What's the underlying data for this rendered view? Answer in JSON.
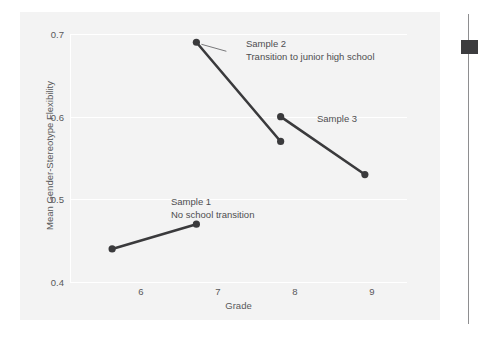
{
  "chart_data": {
    "type": "line",
    "title": "",
    "xlabel": "Grade",
    "ylabel": "Mean Gender-Stereotype Flexibility",
    "xlim": [
      5.5,
      9.5
    ],
    "ylim": [
      0.4,
      0.7
    ],
    "xticks": [
      "6",
      "7",
      "8",
      "9"
    ],
    "xtick_values": [
      6,
      7,
      8,
      9
    ],
    "yticks": [
      "0.4",
      "0.5",
      "0.6",
      "0.7"
    ],
    "ytick_values": [
      0.4,
      0.5,
      0.6,
      0.7
    ],
    "grid": true,
    "legend": "none",
    "series": [
      {
        "name": "Sample 1",
        "x": [
          6,
          7
        ],
        "values": [
          0.44,
          0.47
        ],
        "color": "#3a3a3c",
        "marker": "circle"
      },
      {
        "name": "Sample 2",
        "x": [
          7,
          8
        ],
        "values": [
          0.69,
          0.57
        ],
        "color": "#3a3a3c",
        "marker": "circle"
      },
      {
        "name": "Sample 3",
        "x": [
          8,
          9
        ],
        "values": [
          0.6,
          0.53
        ],
        "color": "#3a3a3c",
        "marker": "circle"
      }
    ],
    "annotations": [
      {
        "id": "sample2",
        "line1": "Sample 2",
        "line2": "Transition to junior high school",
        "points_to": [
          7,
          0.69
        ],
        "leader_line": true
      },
      {
        "id": "sample3",
        "line1": "Sample 3",
        "line2": "",
        "points_to": [
          8,
          0.6
        ],
        "leader_line": false
      },
      {
        "id": "sample1",
        "line1": "Sample 1",
        "line2": "No school transition",
        "points_to": [
          7,
          0.47
        ],
        "leader_line": false
      }
    ]
  },
  "axes": {
    "x_title": "Grade",
    "y_title": "Mean Gender-Stereotype Flexibility",
    "x_labels": [
      "6",
      "7",
      "8",
      "9"
    ],
    "y_labels": [
      "0.7",
      "0.6",
      "0.5",
      "0.4"
    ]
  },
  "annotations": {
    "sample2_line1": "Sample 2",
    "sample2_line2": "Transition to junior high school",
    "sample3_line1": "Sample 3",
    "sample1_line1": "Sample 1",
    "sample1_line2": "No school transition"
  },
  "colors": {
    "series": "#3a3a3c",
    "panel_background": "#f3f3f3",
    "grid": "#ffffff",
    "text": "#58585a",
    "scroll_thumb": "#3c3c3e",
    "scroll_rail": "#8e8e90"
  }
}
